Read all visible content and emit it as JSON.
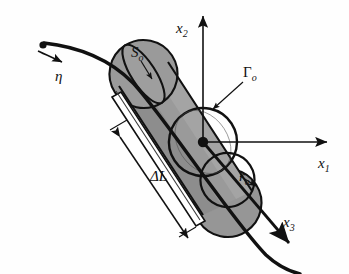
{
  "figure": {
    "background_color": "#fefefe",
    "stroke_color": "#111111",
    "cylinder_fill": "#969696",
    "cylinder_fill_dark": "#8a8a8a",
    "cylinder_fill_light": "#a6a6a6"
  },
  "axes": [
    {
      "id": "x1",
      "name": "x1-axis",
      "symbol": "x",
      "subscript": "1",
      "label_x": 318,
      "label_y": 168,
      "direction": "right"
    },
    {
      "id": "x2",
      "name": "x2-axis",
      "symbol": "x",
      "subscript": "2",
      "label_x": 176,
      "label_y": 33,
      "direction": "up"
    },
    {
      "id": "x3",
      "name": "x3-axis",
      "symbol": "x",
      "subscript": "3",
      "label_x": 283,
      "label_y": 227,
      "direction": "down-right"
    }
  ],
  "labels": [
    {
      "id": "S_o",
      "name": "surface-label",
      "symbol": "S",
      "subscript": "o",
      "label_x": 131,
      "label_y": 57,
      "leader": "points to lateral cylinder surface"
    },
    {
      "id": "Gamma_o",
      "name": "cross-section-label",
      "symbol": "Γ",
      "subscript": "o",
      "label_x": 243,
      "label_y": 77,
      "leader": "points to circular cross-section rim"
    },
    {
      "id": "eta",
      "name": "curve-parameter-label",
      "symbol": "η",
      "subscript": "",
      "label_x": 56,
      "label_y": 80,
      "leader": "tangent direction along curve"
    },
    {
      "id": "delta_L",
      "name": "length-dimension-label",
      "symbol": "ΔL",
      "subscript": "",
      "label_x": 152,
      "label_y": 181,
      "leader": "double headed dimension arrow along cylinder axis"
    },
    {
      "id": "r_o",
      "name": "radius-label",
      "symbol": "r",
      "subscript": "o",
      "label_x": 241,
      "label_y": 181,
      "leader": "radius arrow from center to circle edge"
    }
  ],
  "elements": {
    "origin_dot": {
      "name": "origin-point",
      "x": 203,
      "y": 142
    },
    "curve_start_dot": {
      "name": "curve-start-point",
      "x": 42,
      "y": 46
    },
    "cylinder": {
      "name": "cylinder-body",
      "axis_angle_deg": 57
    }
  }
}
